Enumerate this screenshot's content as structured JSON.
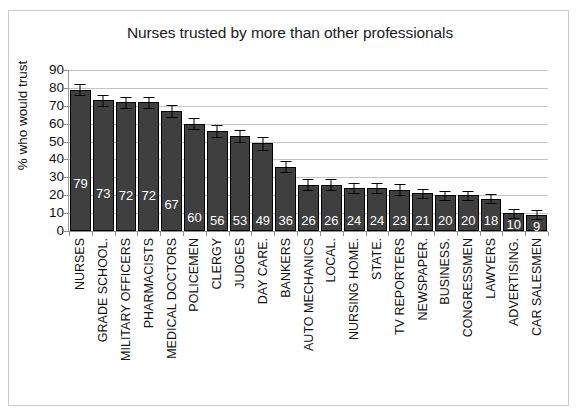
{
  "chart_data": {
    "type": "bar",
    "title": "Nurses trusted by more than other professionals",
    "xlabel": "",
    "ylabel": "% who would trust",
    "ylim": [
      0,
      90
    ],
    "yticks": [
      0,
      10,
      20,
      30,
      40,
      50,
      60,
      70,
      80,
      90
    ],
    "grid": true,
    "legend": false,
    "value_labels_inside_bars": true,
    "error_bars": true,
    "categories": [
      "NURSES",
      "GRADE SCHOOL.",
      "MILITARY OFFICERS",
      "PHARMACISTS",
      "MEDICAL DOCTORS",
      "POLICEMEN",
      "CLERGY",
      "JUDGES",
      "DAY CARE.",
      "BANKERS",
      "AUTO MECHANICS",
      "LOCAL.",
      "NURSING HOME.",
      "STATE.",
      "TV REPORTERS",
      "NEWSPAPER.",
      "BUSINESS.",
      "CONGRESSMEN",
      "LAWYERS",
      "ADVERTISING.",
      "CAR SALESMEN"
    ],
    "values": [
      79,
      73,
      72,
      72,
      67,
      60,
      56,
      53,
      49,
      36,
      26,
      26,
      24,
      24,
      23,
      21,
      20,
      20,
      18,
      10,
      9
    ],
    "errors": [
      3.0,
      3.0,
      3.0,
      3.0,
      3.5,
      3.0,
      3.5,
      3.5,
      3.5,
      3.0,
      3.0,
      3.0,
      3.0,
      3.0,
      3.0,
      2.5,
      2.5,
      2.5,
      2.5,
      2.5,
      2.5
    ],
    "bar_color": "#3f3f3f",
    "bar_edge_color": "#000000",
    "value_label_color": "#ffffff",
    "grid_color": "#c4c4c4",
    "axis_color": "#8f8f8f",
    "background": "#ffffff"
  }
}
